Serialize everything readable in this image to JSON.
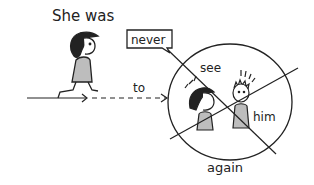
{
  "illustration": {
    "caption_top": "She was",
    "label_never": "never",
    "label_to": "to",
    "label_see": "see",
    "label_him": "him",
    "label_again": "again"
  },
  "colors": {
    "ink": "#222222",
    "fill_gray": "#bdbdbd",
    "background": "#ffffff"
  }
}
